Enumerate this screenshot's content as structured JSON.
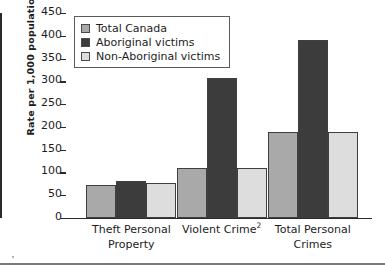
{
  "chart_data": {
    "type": "bar",
    "title": "",
    "xlabel": "",
    "ylabel": "Rate per 1,000 population",
    "ylim": [
      0,
      450
    ],
    "yticks": [
      0,
      50,
      100,
      150,
      200,
      250,
      300,
      350,
      400,
      450
    ],
    "grid": false,
    "legend_position": "upper-left-inside",
    "categories": [
      "Theft Personal Property",
      "Violent Crime2",
      "Total Personal Crimes"
    ],
    "category_lines": [
      [
        "Theft Personal",
        "Property"
      ],
      [
        "Violent Crime",
        "2"
      ],
      [
        "Total Personal",
        "Crimes"
      ]
    ],
    "series": [
      {
        "name": "Total Canada",
        "color": "#a9a9a9",
        "values": [
          73,
          110,
          188
        ]
      },
      {
        "name": "Aboriginal victims",
        "color": "#3c3c3c",
        "values": [
          82,
          308,
          390
        ]
      },
      {
        "name": "Non-Aboriginal victims",
        "color": "#dddddd",
        "values": [
          77,
          109,
          189
        ]
      }
    ]
  },
  "axis": {
    "tick_labels": [
      "450",
      "400",
      "350",
      "300",
      "250",
      "200",
      "150",
      "100",
      "50",
      "0"
    ],
    "y_title": "Rate per 1,000 population"
  },
  "legend": {
    "items": [
      {
        "label": "Total Canada"
      },
      {
        "label": "Aboriginal victims"
      },
      {
        "label": "Non-Aboriginal victims"
      }
    ]
  },
  "categories": {
    "c0_line1": "Theft Personal",
    "c0_line2": "Property",
    "c1_line1": "Violent Crime",
    "c1_sup": "2",
    "c2_line1": "Total Personal",
    "c2_line2": "Crimes"
  }
}
